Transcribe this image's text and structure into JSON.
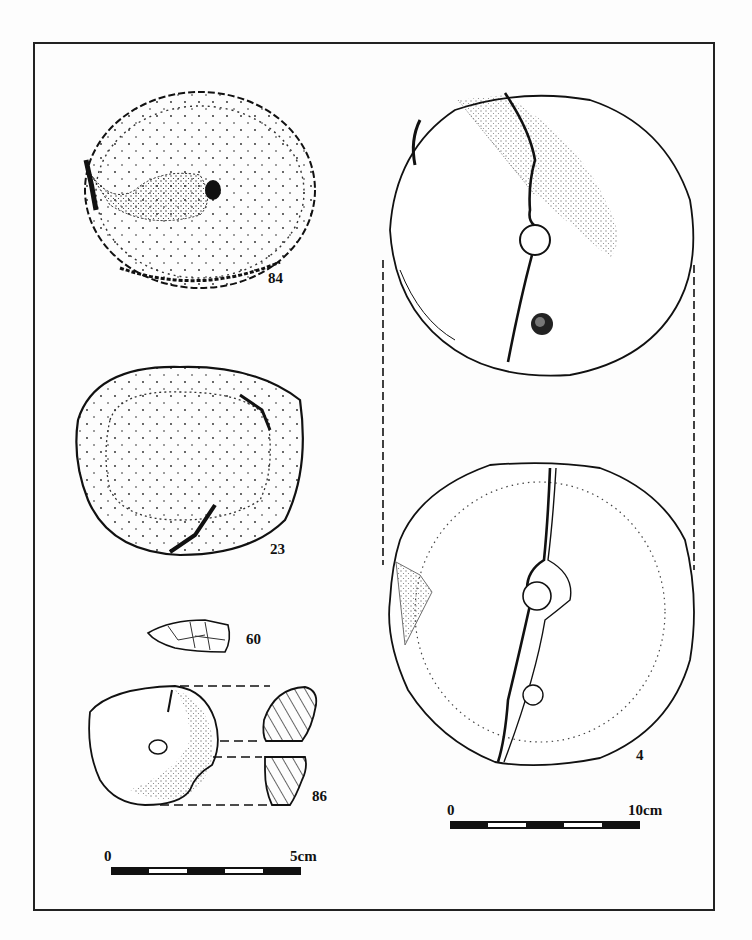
{
  "plate": {
    "type": "archaeological artifact drawing plate",
    "caption": ""
  },
  "artifacts": [
    {
      "id": "84",
      "label": "84",
      "description": "round stone disc, stippled"
    },
    {
      "id": "23",
      "label": "23",
      "description": "round stone disc, stippled with inner ring"
    },
    {
      "id": "60",
      "label": "60",
      "description": "small flaked fragment"
    },
    {
      "id": "86",
      "label": "86",
      "description": "perforated disc with hatched section profiles"
    },
    {
      "id": "4",
      "label": "4",
      "description": "large perforated millstone, two views, cracked"
    }
  ],
  "scale_bars": {
    "small": {
      "start_label": "0",
      "end_label": "5cm",
      "segments": 5
    },
    "large": {
      "start_label": "0",
      "end_label": "10cm",
      "segments": 5
    }
  },
  "colors": {
    "ink": "#111111",
    "paper": "#fdfdfd"
  }
}
